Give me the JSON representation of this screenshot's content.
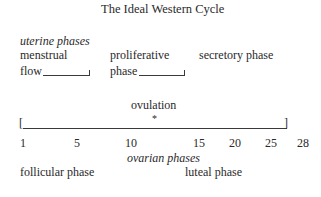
{
  "title": "The Ideal Western Cycle",
  "uterine": {
    "heading": "uterine phases",
    "menstrual_line1": "menstrual",
    "menstrual_line2": "flow",
    "proliferative_line1": "proliferative",
    "proliferative_line2": "phase",
    "secretory": "secretory phase"
  },
  "ovulation": {
    "label": "ovulation",
    "marker": "*"
  },
  "axis": {
    "ticks": [
      "1",
      "5",
      "10",
      "15",
      "20",
      "25",
      "28"
    ],
    "bracket_left": "[",
    "bracket_right": "]"
  },
  "ovarian": {
    "heading": "ovarian phases",
    "follicular": "follicular phase",
    "luteal": "luteal phase"
  }
}
